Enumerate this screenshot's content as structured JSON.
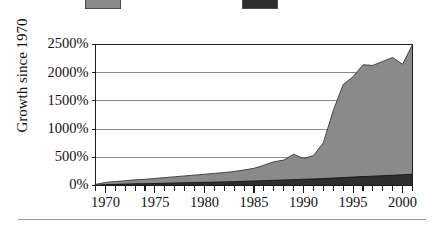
{
  "figure": {
    "background": "#ffffff",
    "bottom_rule": true
  },
  "legend": {
    "position": "top",
    "cropped": true,
    "entries": [
      {
        "name": "series-gray-swatch",
        "color": "#8a8a8a",
        "label": ""
      },
      {
        "name": "series-dark-swatch",
        "color": "#2e2e2e",
        "label": ""
      }
    ]
  },
  "chart_data": {
    "type": "area",
    "stacked": false,
    "title": "",
    "xlabel": "",
    "ylabel": "Growth since 1970",
    "xlim": [
      1969,
      2001
    ],
    "ylim": [
      0,
      2500
    ],
    "grid": true,
    "ytick_labels": [
      "0%",
      "500%",
      "1000%",
      "1500%",
      "2000%",
      "2500%"
    ],
    "ytick_values": [
      0,
      500,
      1000,
      1500,
      2000,
      2500
    ],
    "xtick_labels": [
      "1970",
      "1975",
      "1980",
      "1985",
      "1990",
      "1995",
      "2000"
    ],
    "xtick_values": [
      1970,
      1975,
      1980,
      1985,
      1990,
      1995,
      2000
    ],
    "x_minor_tick_step": 1,
    "x": [
      1969,
      1970,
      1971,
      1972,
      1973,
      1974,
      1975,
      1976,
      1977,
      1978,
      1979,
      1980,
      1981,
      1982,
      1983,
      1984,
      1985,
      1986,
      1987,
      1988,
      1989,
      1990,
      1991,
      1992,
      1993,
      1994,
      1995,
      1996,
      1997,
      1998,
      1999,
      2000,
      2001
    ],
    "series": [
      {
        "name": "gray-series",
        "color": "#8a8a8a",
        "edge_color": "#3a3a3a",
        "values": [
          20,
          55,
          70,
          85,
          100,
          110,
          125,
          140,
          155,
          170,
          185,
          200,
          215,
          230,
          250,
          275,
          305,
          360,
          420,
          450,
          555,
          480,
          530,
          760,
          1330,
          1790,
          1930,
          2140,
          2130,
          2200,
          2270,
          2150,
          2500
        ]
      },
      {
        "name": "dark-series",
        "color": "#2e2e2e",
        "edge_color": "#141414",
        "values": [
          5,
          15,
          20,
          25,
          30,
          32,
          36,
          40,
          44,
          48,
          52,
          56,
          60,
          64,
          68,
          74,
          80,
          86,
          92,
          98,
          104,
          110,
          116,
          124,
          132,
          140,
          150,
          158,
          166,
          174,
          182,
          190,
          200
        ]
      }
    ]
  }
}
